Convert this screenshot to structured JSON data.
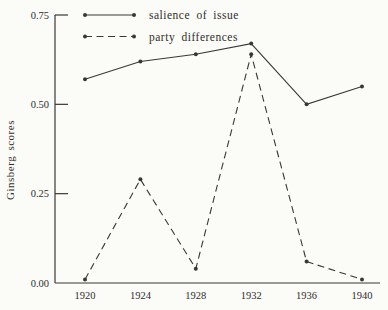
{
  "figure": {
    "background_color": "#fbfbf8",
    "ink_color": "#3a3835"
  },
  "chart_data": {
    "type": "line",
    "title": "",
    "xlabel": "",
    "ylabel": "Ginsberg scores",
    "x": [
      1920,
      1924,
      1928,
      1932,
      1936,
      1940
    ],
    "xtick_labels": [
      "1920",
      "1924",
      "1928",
      "1932",
      "1936",
      "1940"
    ],
    "ylim": [
      0.0,
      0.75
    ],
    "yticks": [
      0.0,
      0.25,
      0.5,
      0.75
    ],
    "ytick_labels": [
      "0.00",
      "0.25",
      "0.50",
      "0.75"
    ],
    "grid": false,
    "legend_position": "top-left-inside",
    "series": [
      {
        "name": "salience of issue",
        "line_style": "solid",
        "marker": "dot",
        "values": [
          0.57,
          0.62,
          0.64,
          0.67,
          0.5,
          0.55
        ]
      },
      {
        "name": "party differences",
        "line_style": "dashed",
        "marker": "dot",
        "values": [
          0.01,
          0.29,
          0.04,
          0.64,
          0.06,
          0.01
        ]
      }
    ]
  }
}
